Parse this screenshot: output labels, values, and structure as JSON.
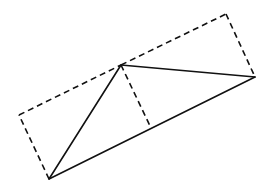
{
  "diagram": {
    "type": "geometry",
    "colors": {
      "stroke": "#111111",
      "background": "#ffffff"
    },
    "points": {
      "A": [
        49,
        179
      ],
      "B": [
        255,
        77
      ],
      "C": [
        121,
        65
      ],
      "D": [
        151,
        128
      ],
      "E": [
        226,
        14
      ],
      "F": [
        19,
        115
      ]
    },
    "solid_segments": [
      [
        "A",
        "B"
      ],
      [
        "A",
        "C"
      ],
      [
        "C",
        "B"
      ]
    ],
    "dashed_segments": [
      [
        "A",
        "F"
      ],
      [
        "F",
        "C"
      ],
      [
        "C",
        "E"
      ],
      [
        "E",
        "B"
      ],
      [
        "C",
        "D"
      ]
    ]
  }
}
